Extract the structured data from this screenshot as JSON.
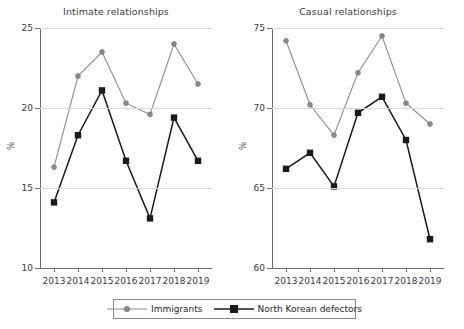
{
  "figure": {
    "ylabel": "%",
    "legend": {
      "items": [
        {
          "label": "Immigrants",
          "marker": "circle-marker",
          "color": "#8c8c8c"
        },
        {
          "label": "North Korean defectors",
          "marker": "square-marker",
          "color": "#1a1a1a"
        }
      ]
    }
  },
  "chart_data": [
    {
      "type": "line",
      "title": "Intimate relationships",
      "xlabel": "",
      "ylabel": "%",
      "grid": true,
      "legend_position": "bottom",
      "categories": [
        "2013",
        "2014",
        "2015",
        "2016",
        "2017",
        "2018",
        "2019"
      ],
      "x": [
        2013,
        2014,
        2015,
        2016,
        2017,
        2018,
        2019
      ],
      "ylim": [
        10,
        25
      ],
      "yticks": [
        10,
        15,
        20,
        25
      ],
      "series": [
        {
          "name": "Immigrants",
          "color": "#8c8c8c",
          "marker": "circle",
          "values": [
            16.3,
            22.0,
            23.5,
            20.3,
            19.6,
            24.0,
            21.5
          ]
        },
        {
          "name": "North Korean defectors",
          "color": "#1a1a1a",
          "marker": "square",
          "values": [
            14.1,
            18.3,
            21.1,
            16.7,
            13.1,
            19.4,
            16.7
          ]
        }
      ]
    },
    {
      "type": "line",
      "title": "Casual relationships",
      "xlabel": "",
      "ylabel": "%",
      "grid": true,
      "legend_position": "bottom",
      "categories": [
        "2013",
        "2014",
        "2015",
        "2016",
        "2017",
        "2018",
        "2019"
      ],
      "x": [
        2013,
        2014,
        2015,
        2016,
        2017,
        2018,
        2019
      ],
      "ylim": [
        60,
        75
      ],
      "yticks": [
        60,
        65,
        70,
        75
      ],
      "series": [
        {
          "name": "Immigrants",
          "color": "#8c8c8c",
          "marker": "circle",
          "values": [
            74.2,
            70.2,
            68.3,
            72.2,
            74.5,
            70.3,
            69.0
          ]
        },
        {
          "name": "North Korean defectors",
          "color": "#1a1a1a",
          "marker": "square",
          "values": [
            66.2,
            67.2,
            65.1,
            69.7,
            70.7,
            68.0,
            61.8
          ]
        }
      ]
    }
  ]
}
